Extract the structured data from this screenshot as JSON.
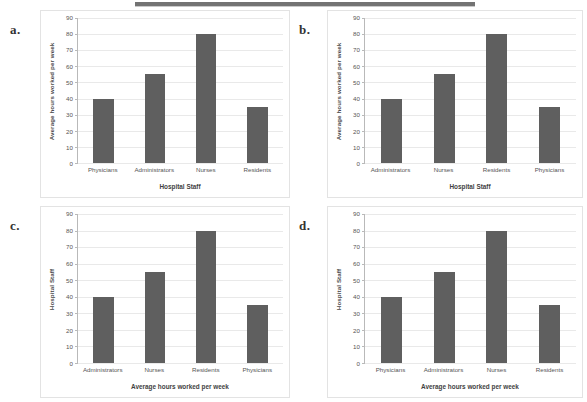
{
  "page": {
    "background_color": "#ffffff",
    "bar_color": "#5f5f5f",
    "gridline_color": "#e9e9e9",
    "axis_color": "#b9b9b9"
  },
  "top_band": {
    "name": "scan-artifact-band",
    "color": "#5a5a5a"
  },
  "panels": [
    {
      "letter": "a.",
      "chart_data": {
        "type": "bar",
        "title": "",
        "categories": [
          "Physicians",
          "Administrators",
          "Nurses",
          "Residents"
        ],
        "values": [
          40,
          55,
          80,
          35
        ],
        "xlabel": "Hospital Staff",
        "ylabel": "Average hours worked per week",
        "ylim": [
          0,
          90
        ],
        "yticks": [
          0,
          10,
          20,
          30,
          40,
          50,
          60,
          70,
          80,
          90
        ],
        "ytick_labels": [
          "0",
          "10",
          "20",
          "30",
          "40",
          "50",
          "60",
          "70",
          "80",
          "90"
        ],
        "grid": true,
        "legend": "none"
      }
    },
    {
      "letter": "b.",
      "chart_data": {
        "type": "bar",
        "title": "",
        "categories": [
          "Administrators",
          "Nurses",
          "Residents",
          "Physicians"
        ],
        "values": [
          40,
          55,
          80,
          35
        ],
        "xlabel": "Hospital Staff",
        "ylabel": "Average hours worked per week",
        "ylim": [
          0,
          90
        ],
        "yticks": [
          0,
          10,
          20,
          30,
          40,
          50,
          60,
          70,
          80,
          90
        ],
        "ytick_labels": [
          "0",
          "10",
          "20",
          "30",
          "40",
          "50",
          "60",
          "70",
          "80",
          "90"
        ],
        "grid": true,
        "legend": "none"
      }
    },
    {
      "letter": "c.",
      "chart_data": {
        "type": "bar",
        "title": "",
        "categories": [
          "Administrators",
          "Nurses",
          "Residents",
          "Physicians"
        ],
        "values": [
          40,
          55,
          80,
          35
        ],
        "xlabel": "Average hours worked per week",
        "ylabel": "Hospital Staff",
        "ylim": [
          0,
          90
        ],
        "yticks": [
          0,
          10,
          20,
          30,
          40,
          50,
          60,
          70,
          80,
          90
        ],
        "ytick_labels": [
          "0",
          "10",
          "20",
          "30",
          "40",
          "50",
          "60",
          "70",
          "80",
          "90"
        ],
        "grid": true,
        "legend": "none"
      }
    },
    {
      "letter": "d.",
      "chart_data": {
        "type": "bar",
        "title": "",
        "categories": [
          "Physicians",
          "Administrators",
          "Nurses",
          "Residents"
        ],
        "values": [
          40,
          55,
          80,
          35
        ],
        "xlabel": "Average hours worked per week",
        "ylabel": "Hospital Staff",
        "ylim": [
          0,
          90
        ],
        "yticks": [
          0,
          10,
          20,
          30,
          40,
          50,
          60,
          70,
          80,
          90
        ],
        "ytick_labels": [
          "0",
          "10",
          "20",
          "30",
          "40",
          "50",
          "60",
          "70",
          "80",
          "90"
        ],
        "grid": true,
        "legend": "none"
      }
    }
  ]
}
